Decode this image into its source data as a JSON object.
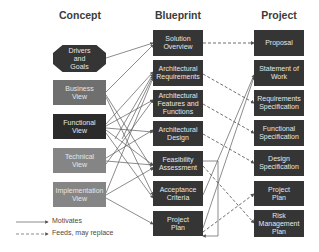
{
  "columns": {
    "concept": {
      "title": "Concept",
      "items": [
        {
          "label": "Drivers and Goals",
          "shape": "octagon",
          "color": "#353535"
        },
        {
          "label": "Business View",
          "shape": "rect",
          "color": "#6f6f6f"
        },
        {
          "label": "Functional View",
          "shape": "rect",
          "color": "#2b2b2b"
        },
        {
          "label": "Technical View",
          "shape": "rect",
          "color": "#858585"
        },
        {
          "label": "Implementation View",
          "shape": "rect",
          "color": "#858585"
        }
      ]
    },
    "blueprint": {
      "title": "Blueprint",
      "items": [
        {
          "label": "Solution Overview"
        },
        {
          "label": "Architectural Requirements"
        },
        {
          "label": "Architectural Features and Functions"
        },
        {
          "label": "Architectural Design"
        },
        {
          "label": "Feasibility Assessment"
        },
        {
          "label": "Acceptance Criteria"
        },
        {
          "label": "Project Plan"
        }
      ]
    },
    "project": {
      "title": "Project",
      "items": [
        {
          "label": "Proposal"
        },
        {
          "label": "Statement of Work"
        },
        {
          "label": "Requirements Specification"
        },
        {
          "label": "Functional Specification"
        },
        {
          "label": "Design Specification"
        },
        {
          "label": "Project Plan"
        },
        {
          "label": "Risk Management Plan"
        }
      ]
    }
  },
  "legend": {
    "motivates": "Motivates",
    "feeds": "Feeds, may replace"
  },
  "colors": {
    "box_dark": "#353535",
    "box_text": "#e6e6e6",
    "line": "#555555",
    "title": "#3b3b3b"
  }
}
